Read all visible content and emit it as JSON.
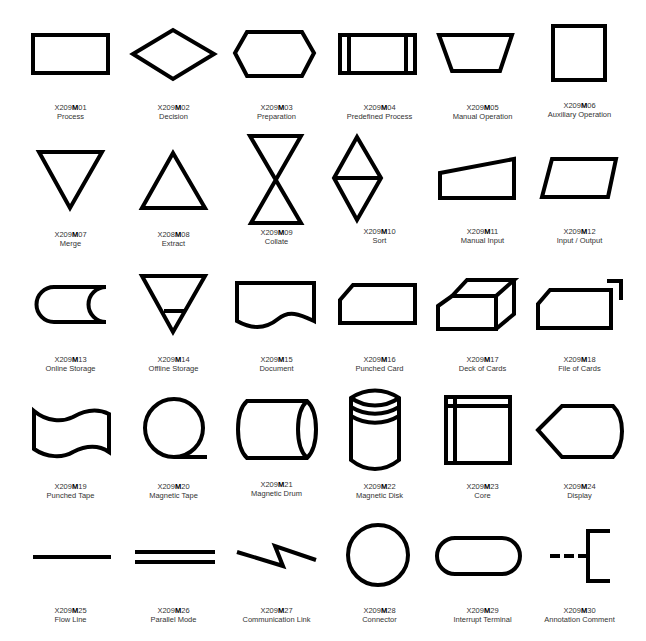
{
  "symbols": [
    {
      "code_prefix": "X209",
      "code_mid": "M",
      "code_num": "01",
      "name": "Process"
    },
    {
      "code_prefix": "X209",
      "code_mid": "M",
      "code_num": "02",
      "name": "Decision"
    },
    {
      "code_prefix": "X209",
      "code_mid": "M",
      "code_num": "03",
      "name": "Preparation"
    },
    {
      "code_prefix": "X209",
      "code_mid": "M",
      "code_num": "04",
      "name": "Predefined Process"
    },
    {
      "code_prefix": "X209",
      "code_mid": "M",
      "code_num": "05",
      "name": "Manual Operation"
    },
    {
      "code_prefix": "X209",
      "code_mid": "M",
      "code_num": "06",
      "name": "Auxiliary Operation"
    },
    {
      "code_prefix": "X209",
      "code_mid": "M",
      "code_num": "07",
      "name": "Merge"
    },
    {
      "code_prefix": "X208",
      "code_mid": "M",
      "code_num": "08",
      "name": "Extract"
    },
    {
      "code_prefix": "X209",
      "code_mid": "M",
      "code_num": "09",
      "name": "Collate"
    },
    {
      "code_prefix": "X209",
      "code_mid": "M",
      "code_num": "10",
      "name": "Sort"
    },
    {
      "code_prefix": "X209",
      "code_mid": "M",
      "code_num": "11",
      "name": "Manual Input"
    },
    {
      "code_prefix": "X209",
      "code_mid": "M",
      "code_num": "12",
      "name": "Input / Output"
    },
    {
      "code_prefix": "X209",
      "code_mid": "M",
      "code_num": "13",
      "name": "Online Storage"
    },
    {
      "code_prefix": "X209",
      "code_mid": "M",
      "code_num": "14",
      "name": "Offline Storage"
    },
    {
      "code_prefix": "X209",
      "code_mid": "M",
      "code_num": "15",
      "name": "Document"
    },
    {
      "code_prefix": "X209",
      "code_mid": "M",
      "code_num": "16",
      "name": "Punched Card"
    },
    {
      "code_prefix": "X209",
      "code_mid": "M",
      "code_num": "17",
      "name": "Deck of Cards"
    },
    {
      "code_prefix": "X209",
      "code_mid": "M",
      "code_num": "18",
      "name": "File of Cards"
    },
    {
      "code_prefix": "X209",
      "code_mid": "M",
      "code_num": "19",
      "name": "Punched Tape"
    },
    {
      "code_prefix": "X209",
      "code_mid": "M",
      "code_num": "20",
      "name": "Magnetic Tape"
    },
    {
      "code_prefix": "X209",
      "code_mid": "M",
      "code_num": "21",
      "name": "Magnetic Drum"
    },
    {
      "code_prefix": "X209",
      "code_mid": "M",
      "code_num": "22",
      "name": "Magnetic Disk"
    },
    {
      "code_prefix": "X209",
      "code_mid": "M",
      "code_num": "23",
      "name": "Core"
    },
    {
      "code_prefix": "X209",
      "code_mid": "M",
      "code_num": "24",
      "name": "Display"
    },
    {
      "code_prefix": "X209",
      "code_mid": "M",
      "code_num": "25",
      "name": "Flow Line"
    },
    {
      "code_prefix": "X209",
      "code_mid": "M",
      "code_num": "26",
      "name": "Parallel Mode"
    },
    {
      "code_prefix": "X209",
      "code_mid": "M",
      "code_num": "27",
      "name": "Communication Link"
    },
    {
      "code_prefix": "X209",
      "code_mid": "M",
      "code_num": "28",
      "name": "Connector"
    },
    {
      "code_prefix": "X209",
      "code_mid": "M",
      "code_num": "29",
      "name": "Interrupt Terminal"
    },
    {
      "code_prefix": "X209",
      "code_mid": "M",
      "code_num": "30",
      "name": "Annotation Comment"
    }
  ]
}
